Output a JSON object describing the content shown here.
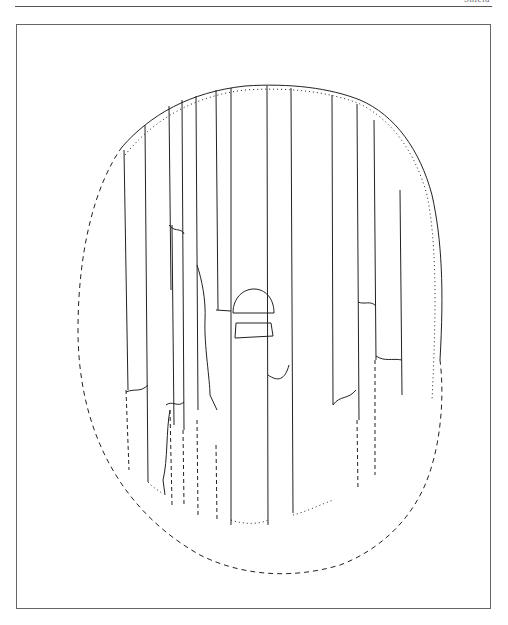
{
  "page": {
    "running_head": "Shield",
    "figure": {
      "subject": "shield-reconstruction-drawing",
      "line_color": "#222222",
      "frame_color": "#666666",
      "elements": {
        "outline": "oval shield outline (solid upper-right, dashed reconstructed left and bottom)",
        "planks": "vertical board seams",
        "boss": "central dome-shaped shield boss with flange",
        "breaks": "irregular fracture lines across planks"
      }
    }
  }
}
